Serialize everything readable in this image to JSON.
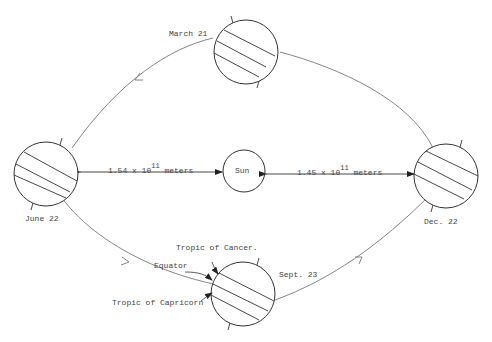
{
  "diagram": {
    "colors": {
      "stroke": "#333333",
      "orbit": "#777777",
      "text": "#444444",
      "background": "#ffffff"
    },
    "sun": {
      "label": "Sun"
    },
    "positions": [
      {
        "id": "march",
        "label": "March 21"
      },
      {
        "id": "june",
        "label": "June 22"
      },
      {
        "id": "sept",
        "label": "Sept. 23"
      },
      {
        "id": "dec",
        "label": "Dec. 22"
      }
    ],
    "distances": {
      "left": {
        "mantissa": "1.54 x 10",
        "exponent": "11",
        "unit": "meters"
      },
      "right": {
        "mantissa": "1.45 x 10",
        "exponent": "11",
        "unit": "meters"
      }
    },
    "latitude_labels": {
      "tropic_cancer": "Tropic of Cancer.",
      "equator": "Equator",
      "tropic_capricorn": "Tropic of Capricorn"
    }
  }
}
